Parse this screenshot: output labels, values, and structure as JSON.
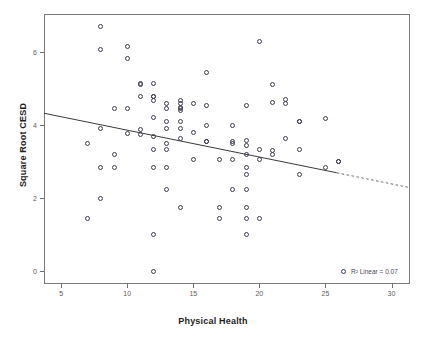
{
  "caption_fragment": "",
  "chart_data": {
    "type": "scatter",
    "title": "",
    "xlabel": "Physical Health",
    "ylabel": "Square Root CESD",
    "xlim": [
      3.7,
      31.4
    ],
    "ylim": [
      -0.35,
      7.05
    ],
    "xticks": [
      5,
      10,
      15,
      20,
      25,
      30
    ],
    "yticks": [
      0,
      2,
      4,
      6
    ],
    "xtick_labels": [
      "5",
      "10",
      "15",
      "20",
      "25",
      "30"
    ],
    "ytick_labels": [
      "0",
      "2",
      "4",
      "6"
    ],
    "grid": false,
    "marker": "open-circle",
    "marker_color": "#3d3d4f",
    "legend": {
      "position": "bottom-right",
      "marker": "open-circle",
      "label": "R² Linear = 0.07"
    },
    "fit_line": {
      "type": "linear",
      "color": "#3a3a3a",
      "x_start": 3.7,
      "y_start": 4.33,
      "x_end": 31.4,
      "y_end": 2.29,
      "slope": -0.0736,
      "intercept": 4.602,
      "r_squared": 0.07
    },
    "x": [
      8,
      8,
      10,
      20,
      10,
      11,
      11,
      12,
      16,
      21,
      12,
      11,
      12,
      12,
      13,
      14,
      14,
      14,
      22,
      9,
      10,
      13,
      14,
      14,
      15,
      16,
      19,
      21,
      22,
      23,
      25,
      12,
      13,
      14,
      16,
      18,
      23,
      26,
      8,
      11,
      15,
      11,
      13,
      14,
      14,
      16,
      18,
      19,
      23,
      7,
      10,
      12,
      13,
      16,
      18,
      19,
      20,
      21,
      9,
      12,
      13,
      15,
      17,
      18,
      19,
      20,
      22,
      26,
      8,
      9,
      12,
      13,
      19,
      21,
      23,
      25,
      19,
      13,
      18,
      19,
      8,
      14,
      17,
      19,
      17,
      19,
      20,
      7,
      12,
      19,
      12
    ],
    "y": [
      6.7,
      6.08,
      6.17,
      6.3,
      5.83,
      5.15,
      5.12,
      5.15,
      5.45,
      5.12,
      4.8,
      4.78,
      4.8,
      4.68,
      4.6,
      4.68,
      4.6,
      4.5,
      4.7,
      4.45,
      4.45,
      4.45,
      4.47,
      4.4,
      4.6,
      4.55,
      4.55,
      4.63,
      4.6,
      4.1,
      4.18,
      4.2,
      4.1,
      4.1,
      4.0,
      4.0,
      4.1,
      3.0,
      3.9,
      3.88,
      3.8,
      3.75,
      3.9,
      3.9,
      3.65,
      3.55,
      3.5,
      3.58,
      3.35,
      3.5,
      3.78,
      3.68,
      3.5,
      3.55,
      3.55,
      3.45,
      3.35,
      3.3,
      3.2,
      3.35,
      3.35,
      3.05,
      3.05,
      3.05,
      3.2,
      3.05,
      3.65,
      3.0,
      2.85,
      2.85,
      2.85,
      2.85,
      2.85,
      3.2,
      2.65,
      2.85,
      2.65,
      2.25,
      2.25,
      2.25,
      2.0,
      1.75,
      1.75,
      1.75,
      1.45,
      1.45,
      1.45,
      1.45,
      1.0,
      1.0,
      0.0
    ]
  }
}
